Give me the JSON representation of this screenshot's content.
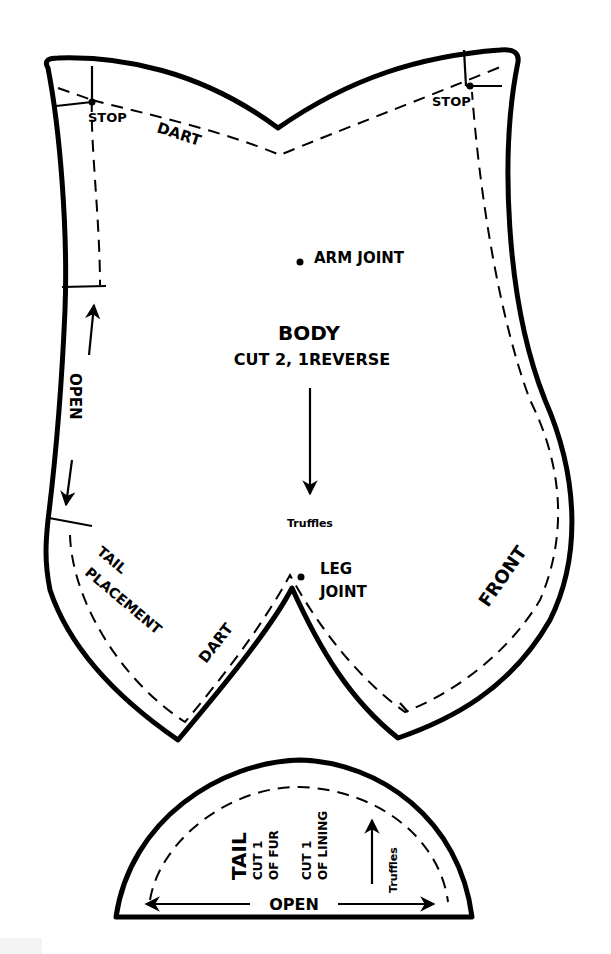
{
  "colors": {
    "line": "#000000",
    "background": "#ffffff"
  },
  "body_piece": {
    "name": "BODY",
    "cut_instructions": "CUT 2,  1REVERSE",
    "grainline_label": "Truffles",
    "labels": {
      "stop_left": "STOP",
      "stop_right": "STOP",
      "dart_top": "DART",
      "dart_bottom": "DART",
      "arm_joint": "ARM JOINT",
      "leg_joint_line1": "LEG",
      "leg_joint_line2": "JOINT",
      "open": "OPEN",
      "tail_placement_line1": "TAIL",
      "tail_placement_line2": "PLACEMENT",
      "front": "FRONT"
    }
  },
  "tail_piece": {
    "name": "TAIL",
    "cut_fur_line1": "CUT 1",
    "cut_fur_line2": "OF FUR",
    "cut_lining_line1": "CUT 1",
    "cut_lining_line2": "OF LINING",
    "grainline_label": "Truffles",
    "open": "OPEN"
  }
}
